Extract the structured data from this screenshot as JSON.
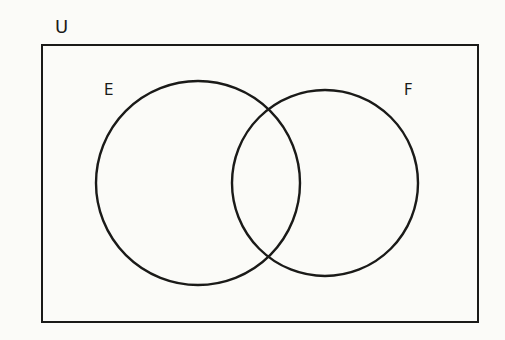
{
  "diagram": {
    "type": "venn",
    "title": "",
    "background_color": "#fbfbf8",
    "stroke_color": "#1a1a18",
    "universe": {
      "label": "U",
      "shape": "rectangle",
      "x": 42,
      "y": 45,
      "width": 436,
      "height": 277,
      "stroke_width": 2.4,
      "label_position": "above-top-left"
    },
    "sets": [
      {
        "id": "E",
        "label": "E",
        "shape": "circle",
        "cx": 198,
        "cy": 183,
        "r": 102,
        "stroke_width": 2.4,
        "fill": "none",
        "label_position": "outside-upper-left"
      },
      {
        "id": "F",
        "label": "F",
        "shape": "circle",
        "cx": 325,
        "cy": 183,
        "r": 93,
        "stroke_width": 2.4,
        "fill": "none",
        "label_position": "outside-upper-right"
      }
    ],
    "relationship": "overlapping",
    "shaded_regions": [],
    "region_labels": []
  }
}
